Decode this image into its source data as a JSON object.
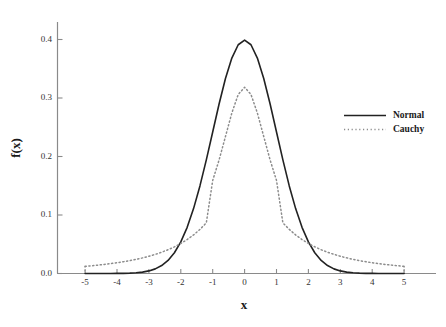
{
  "chart_data": {
    "type": "line",
    "title": "",
    "xlabel": "x",
    "ylabel": "f(x)",
    "xlim": [
      -5.6,
      6.0
    ],
    "ylim": [
      0.0,
      0.44
    ],
    "grid": false,
    "legend_position": "right",
    "xticks": [
      -5,
      -4,
      -3,
      -2,
      -1,
      0,
      1,
      2,
      3,
      4,
      5
    ],
    "xtick_labels": [
      "-5",
      "-4",
      "-3",
      "-2",
      "-1",
      "0",
      "1",
      "2",
      "3",
      "4",
      "5"
    ],
    "yticks": [
      0.0,
      0.1,
      0.2,
      0.3,
      0.4
    ],
    "ytick_labels": [
      "0.0",
      "0.1",
      "0.2",
      "0.3",
      "0.4"
    ],
    "x": [
      -5.0,
      -4.8,
      -4.6,
      -4.4,
      -4.2,
      -4.0,
      -3.8,
      -3.6,
      -3.4,
      -3.2,
      -3.0,
      -2.8,
      -2.6,
      -2.4,
      -2.2,
      -2.0,
      -1.8,
      -1.6,
      -1.4,
      -1.2,
      -1.0,
      -0.8,
      -0.6,
      -0.4,
      -0.2,
      0.0,
      0.2,
      0.4,
      0.6,
      0.8,
      1.0,
      1.2,
      1.4,
      1.6,
      1.8,
      2.0,
      2.2,
      2.4,
      2.6,
      2.8,
      3.0,
      3.2,
      3.4,
      3.6,
      3.8,
      4.0,
      4.2,
      4.4,
      4.6,
      4.8,
      5.0
    ],
    "series": [
      {
        "name": "Normal",
        "style": "solid",
        "color": "#222222",
        "width": 1.6,
        "values": [
          1.5e-06,
          3.9e-06,
          9.6e-06,
          2.27e-05,
          5.14e-05,
          0.0001338,
          0.0002919,
          0.0006119,
          0.0012322,
          0.0023841,
          0.0044318,
          0.0079155,
          0.013583,
          0.0223945,
          0.0354746,
          0.053991,
          0.0789502,
          0.1109208,
          0.1497275,
          0.1941861,
          0.2419707,
          0.2896916,
          0.3332246,
          0.3682701,
          0.3910427,
          0.3989423,
          0.3910427,
          0.3682701,
          0.3332246,
          0.2896916,
          0.2419707,
          0.1941861,
          0.1497275,
          0.1109208,
          0.0789502,
          0.053991,
          0.0354746,
          0.0223945,
          0.013583,
          0.0079155,
          0.0044318,
          0.0023841,
          0.0012322,
          0.0006119,
          0.0002919,
          0.0001338,
          5.14e-05,
          2.27e-05,
          9.6e-06,
          3.9e-06,
          1.5e-06
        ]
      },
      {
        "name": "Cauchy",
        "style": "dotted",
        "color": "#8c8c8c",
        "width": 1.5,
        "values": [
          0.0122457,
          0.0132282,
          0.0143189,
          0.0155332,
          0.0168892,
          0.0184078,
          0.0201139,
          0.0220366,
          0.0242108,
          0.026678,
          0.0294884,
          0.0327022,
          0.0363928,
          0.0406493,
          0.0455814,
          0.0513252,
          0.0580508,
          0.0659728,
          0.0753636,
          0.0865685,
          0.1591549,
          0.1940761,
          0.2341933,
          0.2744116,
          0.3060672,
          0.3183099,
          0.3060672,
          0.2744116,
          0.2341933,
          0.1940761,
          0.1591549,
          0.0865685,
          0.0753636,
          0.0659728,
          0.0580508,
          0.0513252,
          0.0455814,
          0.0406493,
          0.0363928,
          0.0327022,
          0.0294884,
          0.026678,
          0.0242108,
          0.0220366,
          0.0201139,
          0.0184078,
          0.0168892,
          0.0155332,
          0.0143189,
          0.0132282,
          0.0122457
        ]
      }
    ],
    "legend": [
      {
        "label": "Normal",
        "style": "solid",
        "color": "#222222"
      },
      {
        "label": "Cauchy",
        "style": "dotted",
        "color": "#8c8c8c"
      }
    ],
    "axis_color": "#777777",
    "background": "#ffffff"
  }
}
